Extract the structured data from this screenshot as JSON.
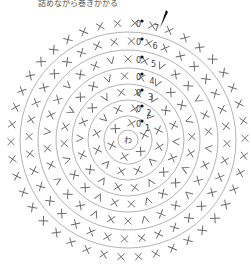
{
  "caption": "詰めながら巻きかかる",
  "center_label": "わ",
  "round_labels": [
    "1",
    "2",
    "3",
    "4",
    "5",
    "6",
    "7"
  ],
  "colors": {
    "ring": "#aaaaaa",
    "stitch": "#666666",
    "text": "#444444"
  },
  "rings": [
    {
      "r": 10
    },
    {
      "r": 24
    },
    {
      "r": 40
    },
    {
      "r": 56
    },
    {
      "r": 72
    },
    {
      "r": 90
    },
    {
      "r": 108
    }
  ]
}
